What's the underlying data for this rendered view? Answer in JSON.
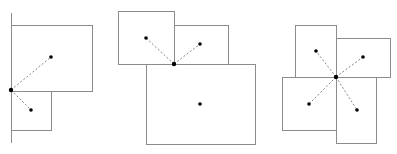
{
  "diagram": {
    "stroke_color": "#8c8c8c",
    "dot_color": "#000000",
    "dash_color": "#888888",
    "panels": [
      {
        "name": "panel-1",
        "lines": [
          {
            "x1": 11,
            "y1": 13,
            "x2": 11,
            "y2": 143
          }
        ],
        "rects": [
          {
            "x": 11,
            "y": 25,
            "w": 81,
            "h": 66
          },
          {
            "x": 11,
            "y": 91,
            "w": 40,
            "h": 39
          }
        ],
        "hub": {
          "x": 11,
          "y": 90
        },
        "dots": [
          {
            "x": 51,
            "y": 57
          },
          {
            "x": 31,
            "y": 110
          }
        ]
      },
      {
        "name": "panel-2",
        "lines": [],
        "rects": [
          {
            "x": 118,
            "y": 11,
            "w": 56,
            "h": 53
          },
          {
            "x": 174,
            "y": 25,
            "w": 54,
            "h": 39
          },
          {
            "x": 146,
            "y": 64,
            "w": 109,
            "h": 80
          }
        ],
        "hub": {
          "x": 174,
          "y": 64
        },
        "dots": [
          {
            "x": 146,
            "y": 38
          },
          {
            "x": 200,
            "y": 44
          }
        ],
        "extra_dots": [
          {
            "x": 200,
            "y": 104
          }
        ]
      },
      {
        "name": "panel-3",
        "lines": [],
        "rects": [
          {
            "x": 295,
            "y": 25,
            "w": 41,
            "h": 52
          },
          {
            "x": 336,
            "y": 38,
            "w": 54,
            "h": 39
          },
          {
            "x": 282,
            "y": 77,
            "w": 54,
            "h": 53
          },
          {
            "x": 336,
            "y": 77,
            "w": 40,
            "h": 66
          }
        ],
        "hub": {
          "x": 336,
          "y": 77
        },
        "dots": [
          {
            "x": 316,
            "y": 51
          },
          {
            "x": 363,
            "y": 57
          },
          {
            "x": 309,
            "y": 104
          },
          {
            "x": 357,
            "y": 110
          }
        ]
      }
    ],
    "caption": ""
  }
}
